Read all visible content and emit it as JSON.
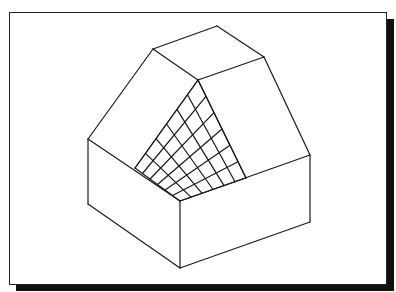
{
  "figure": {
    "frame": {
      "border_color": "#222222",
      "shadow_color": "#111111",
      "background": "#ffffff"
    },
    "grid": {
      "rows": 6,
      "cols": 6
    },
    "vertices": {
      "roof_left": [
        153,
        49
      ],
      "roof_top": [
        217,
        26
      ],
      "roof_right": [
        264,
        57
      ],
      "ridge_center": [
        198,
        80
      ],
      "base_left_top": [
        88,
        139
      ],
      "base_front_top": [
        180,
        201
      ],
      "base_right_top": [
        310,
        155
      ],
      "base_left_bottom": [
        88,
        204
      ],
      "base_front_bottom": [
        180,
        268
      ],
      "base_right_bottom": [
        310,
        222
      ],
      "grid_left": [
        135,
        168
      ],
      "grid_right": [
        246,
        178
      ]
    }
  }
}
